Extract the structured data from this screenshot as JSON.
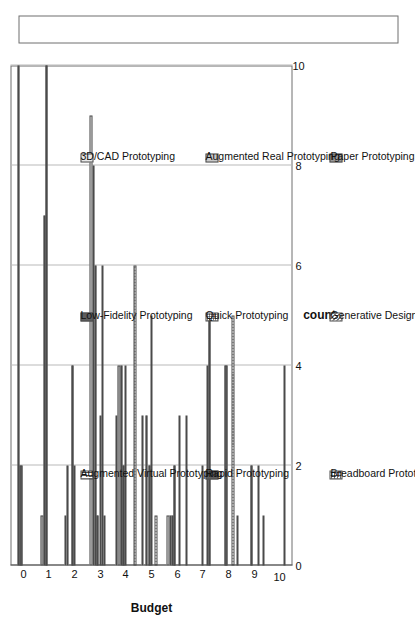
{
  "chart_data": {
    "type": "bar",
    "orientation": "vertical-rendered-rotated",
    "title": "",
    "xlabel": "Budget",
    "ylabel": "count",
    "categories": [
      "0",
      "1",
      "2",
      "3",
      "4",
      "5",
      "6",
      "7",
      "8",
      "9",
      "10"
    ],
    "ylim": [
      0,
      10
    ],
    "yticks": [
      "0",
      "2",
      "4",
      "6",
      "8",
      "10"
    ],
    "grid": "value-axis-only",
    "legend_position": "right",
    "series": [
      {
        "name": "3D/CAD Prototyping",
        "pattern": "solid-light",
        "values": [
          0,
          0,
          1,
          9,
          3,
          3,
          1,
          0,
          0,
          0,
          0
        ]
      },
      {
        "name": "Augmented Real Prototyping",
        "pattern": "solid-med",
        "values": [
          0,
          1,
          2,
          8,
          4,
          0,
          1,
          0,
          0,
          0,
          0
        ]
      },
      {
        "name": "Paper Prototyping",
        "pattern": "solid-dark",
        "values": [
          10,
          7,
          0,
          6,
          4,
          3,
          1,
          0,
          0,
          0,
          0
        ]
      },
      {
        "name": "Low-Fidelity Prototyping",
        "pattern": "solid-darker",
        "values": [
          2,
          10,
          4,
          1,
          2,
          2,
          2,
          0,
          4,
          2,
          0
        ]
      },
      {
        "name": "Quick Prototyping",
        "pattern": "dots-fine",
        "values": [
          0,
          0,
          2,
          3,
          4,
          5,
          0,
          2,
          0,
          0,
          0
        ]
      },
      {
        "name": "Generative Design Prototyping",
        "pattern": "checker",
        "values": [
          0,
          0,
          0,
          6,
          0,
          0,
          3,
          0,
          0,
          0,
          0
        ]
      },
      {
        "name": "Augmented Virtual Prototyping",
        "pattern": "vlines",
        "values": [
          0,
          0,
          0,
          1,
          0,
          1,
          0,
          4,
          5,
          2,
          4
        ]
      },
      {
        "name": "Rapid Prototyping",
        "pattern": "solid-darker",
        "values": [
          0,
          0,
          0,
          0,
          0,
          0,
          0,
          5,
          0,
          0,
          0
        ]
      },
      {
        "name": "Breadboard Prototyping",
        "pattern": "dots-coarse",
        "values": [
          0,
          0,
          0,
          0,
          6,
          0,
          3,
          0,
          1,
          1,
          0
        ]
      }
    ]
  },
  "axes": {
    "x_title": "Budget",
    "y_title": "count",
    "y_ticks": [
      "0",
      "2",
      "4",
      "6",
      "8",
      "10"
    ],
    "x_ticks": [
      "0",
      "1",
      "2",
      "3",
      "4",
      "5",
      "6",
      "7",
      "8",
      "9",
      "10"
    ]
  },
  "legend": {
    "columns": [
      {
        "items": [
          {
            "label": "3D/CAD Prototyping",
            "pattern": "solid-light"
          },
          {
            "label": "Augmented Real Prototyping",
            "pattern": "solid-med"
          },
          {
            "label": "Paper Prototyping",
            "pattern": "solid-dark"
          }
        ]
      },
      {
        "items": [
          {
            "label": "Low-Fidelity Prototyping",
            "pattern": "solid-darker"
          },
          {
            "label": "Quick Prototyping",
            "pattern": "dots-fine"
          },
          {
            "label": "Generative Design Prototyping",
            "pattern": "checker"
          }
        ]
      },
      {
        "items": [
          {
            "label": "Augmented Virtual Prototyping",
            "pattern": "vlines"
          },
          {
            "label": "Rapid Prototyping",
            "pattern": "solid-darker"
          },
          {
            "label": "Breadboard Prototyping",
            "pattern": "dots-coarse"
          }
        ]
      }
    ]
  },
  "caption": ""
}
